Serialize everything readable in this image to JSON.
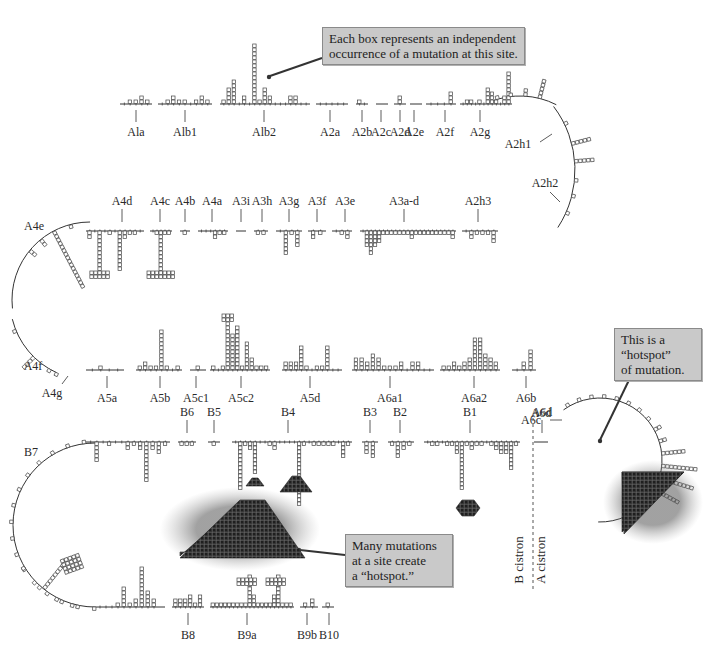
{
  "figure": {
    "colors": {
      "line": "#333333",
      "box_fill": "#ffffff",
      "box_stroke": "#444444",
      "hotspot_fill": "#2b2b2b",
      "callout_bg": "#c9c9c9",
      "callout_border": "#8a8a8a"
    }
  },
  "callouts": {
    "top": {
      "lines": [
        "Each box represents an independent",
        "occurrence of a mutation at this site."
      ]
    },
    "right": {
      "lines": [
        "This is a",
        "“hotspot”",
        "of mutation."
      ]
    },
    "bottom": {
      "lines": [
        "Many mutations",
        "at a site create",
        "a “hotspot.”"
      ]
    }
  },
  "cistron_divider": {
    "b_label": "B cistron",
    "a_label": "A cistron"
  },
  "rows": {
    "row1": {
      "y": 104,
      "segments": [
        {
          "label": "Ala",
          "x1": 120,
          "x2": 152,
          "lx": 136,
          "sites": [
            0,
            1,
            1,
            2,
            1
          ]
        },
        {
          "label": "Alb1",
          "x1": 158,
          "x2": 212,
          "lx": 185,
          "sites": [
            0,
            1,
            2,
            1,
            1,
            0,
            1,
            2,
            1
          ]
        },
        {
          "label": "Alb2",
          "x1": 220,
          "x2": 310,
          "lx": 264,
          "sites": [
            1,
            4,
            6,
            0,
            2,
            0,
            15,
            1,
            4,
            2,
            0,
            0,
            0,
            2,
            2,
            0,
            0
          ]
        },
        {
          "label": "A2a",
          "x1": 316,
          "x2": 348,
          "lx": 330,
          "sites": [
            0,
            0,
            0,
            0,
            0
          ]
        },
        {
          "label": "A2b",
          "x1": 356,
          "x2": 368,
          "lx": 362,
          "sites": [
            1,
            0
          ]
        },
        {
          "label": "A2c",
          "x1": 376,
          "x2": 388,
          "lx": 381,
          "sites": []
        },
        {
          "label": "A2d",
          "x1": 394,
          "x2": 406,
          "lx": 400,
          "sites": [
            2
          ]
        },
        {
          "label": "A2e",
          "x1": 410,
          "x2": 422,
          "lx": 414,
          "sites": []
        },
        {
          "label": "A2f",
          "x1": 426,
          "x2": 456,
          "lx": 445,
          "sites": [
            0,
            0,
            0,
            3
          ]
        },
        {
          "label": "A2g",
          "x1": 460,
          "x2": 512,
          "lx": 480,
          "sites": [
            0,
            1,
            1,
            0,
            1,
            0,
            4,
            3,
            1,
            0,
            2,
            8
          ]
        }
      ]
    },
    "row2": {
      "y": 231,
      "segments": [
        {
          "label": "A4d",
          "x1": 86,
          "x2": 144,
          "lx": 122,
          "down": [
            2,
            0,
            10,
            0,
            1,
            0,
            10,
            2,
            1,
            1,
            0
          ],
          "caps": [
            [
              2,
              4
            ]
          ]
        },
        {
          "label": "A4c",
          "x1": 150,
          "x2": 172,
          "lx": 160,
          "down": [
            0,
            1,
            10,
            1,
            1
          ],
          "caps": [
            [
              2,
              6
            ]
          ]
        },
        {
          "label": "A4b",
          "x1": 180,
          "x2": 190,
          "lx": 185,
          "down": [
            1
          ]
        },
        {
          "label": "A4a",
          "x1": 198,
          "x2": 228,
          "lx": 212,
          "down": [
            0,
            0,
            0,
            2,
            1,
            1
          ]
        },
        {
          "label": "A3i",
          "x1": 236,
          "x2": 246,
          "lx": 241,
          "down": []
        },
        {
          "label": "A3h",
          "x1": 254,
          "x2": 268,
          "lx": 262,
          "down": [
            1,
            1
          ]
        },
        {
          "label": "A3g",
          "x1": 276,
          "x2": 302,
          "lx": 289,
          "down": [
            0,
            6,
            1,
            4
          ]
        },
        {
          "label": "A3f",
          "x1": 308,
          "x2": 326,
          "lx": 317,
          "down": [
            2,
            1
          ]
        },
        {
          "label": "A3e",
          "x1": 332,
          "x2": 352,
          "lx": 345,
          "down": [
            0,
            1,
            2
          ]
        },
        {
          "label": "A3a-d",
          "x1": 360,
          "x2": 456,
          "lx": 404,
          "down": [
            0,
            4,
            6,
            4,
            3,
            1,
            1,
            1,
            1,
            1,
            1,
            1,
            2,
            1,
            1,
            1,
            1,
            1,
            1,
            1,
            1,
            1,
            2
          ]
        },
        {
          "label": "A2h3",
          "x1": 462,
          "x2": 498,
          "lx": 478,
          "down": [
            0,
            2,
            1,
            1,
            1,
            3
          ]
        }
      ]
    },
    "row3": {
      "y": 370,
      "segments": [
        {
          "label": "A5a",
          "x1": 86,
          "x2": 124,
          "lx": 107,
          "sites": [
            0,
            1,
            0,
            0
          ]
        },
        {
          "label": "A5b",
          "x1": 136,
          "x2": 182,
          "lx": 160,
          "sites": [
            1,
            2,
            1,
            1,
            10,
            1,
            0,
            1
          ]
        },
        {
          "label": "A5c1",
          "x1": 190,
          "x2": 206,
          "lx": 196,
          "sites": [
            1
          ]
        },
        {
          "label": "A5c2",
          "x1": 210,
          "x2": 270,
          "lx": 241,
          "sites": [
            1,
            0,
            1,
            12,
            9,
            11,
            1,
            7,
            3,
            1,
            1,
            1
          ],
          "caps": [
            [
              3,
              3
            ]
          ]
        },
        {
          "label": "A5d",
          "x1": 282,
          "x2": 342,
          "lx": 310,
          "sites": [
            2,
            2,
            2,
            6,
            1,
            0,
            1,
            1,
            6,
            0,
            0
          ]
        },
        {
          "label": "A6a1",
          "x1": 352,
          "x2": 434,
          "lx": 390,
          "sites": [
            3,
            3,
            2,
            4,
            3,
            1,
            1,
            1,
            2,
            0,
            2,
            2,
            0,
            0
          ]
        },
        {
          "label": "A6a2",
          "x1": 440,
          "x2": 500,
          "lx": 474,
          "sites": [
            1,
            1,
            2,
            1,
            2,
            3,
            8,
            8,
            4,
            3,
            2
          ]
        },
        {
          "label": "A6b",
          "x1": 512,
          "x2": 536,
          "lx": 526,
          "sites": [
            0,
            2,
            5
          ]
        }
      ]
    },
    "row4": {
      "y": 442,
      "segments": [
        {
          "label": "B7",
          "x1": 86,
          "x2": 170,
          "lx": null,
          "down": [
            0,
            5,
            0,
            1,
            0,
            0,
            2,
            1,
            2,
            10,
            2,
            3,
            1
          ]
        },
        {
          "label": "B6",
          "x1": 178,
          "x2": 196,
          "lx": 187,
          "down": [
            1,
            1,
            1
          ]
        },
        {
          "label": "B5",
          "x1": 208,
          "x2": 220,
          "lx": 214,
          "down": [
            1
          ]
        },
        {
          "label": "B4",
          "x1": 232,
          "x2": 352,
          "lx": 288,
          "down": [
            0,
            12,
            1,
            2,
            8,
            0,
            0,
            1,
            2,
            0,
            0,
            0,
            0,
            16,
            1,
            0,
            1,
            1,
            1,
            1,
            1,
            0,
            4,
            1
          ]
        },
        {
          "label": "B3",
          "x1": 362,
          "x2": 378,
          "lx": 370,
          "down": [
            3,
            4
          ]
        },
        {
          "label": "B2",
          "x1": 388,
          "x2": 414,
          "lx": 400,
          "down": [
            1,
            4,
            2,
            1
          ]
        },
        {
          "label": "B1",
          "x1": 424,
          "x2": 520,
          "lx": 470,
          "down": [
            0,
            1,
            1,
            0,
            1,
            1,
            3,
            12,
            1,
            2,
            1,
            1,
            0,
            1,
            2,
            3,
            3,
            7,
            1
          ]
        },
        {
          "label": "A6d",
          "x1": 534,
          "x2": 548,
          "lx": 542,
          "down": []
        }
      ]
    },
    "row5": {
      "y": 607,
      "segments": [
        {
          "label": "B8",
          "x1": 172,
          "x2": 204,
          "lx": 188,
          "sites": [
            2,
            2,
            2,
            3,
            1,
            3
          ]
        },
        {
          "label": "B9a",
          "x1": 210,
          "x2": 294,
          "lx": 247,
          "sites": [
            1,
            1,
            1,
            1,
            1,
            1,
            1,
            1,
            1,
            8,
            3,
            1,
            1,
            1,
            1,
            3,
            8,
            1,
            1,
            1
          ]
        },
        {
          "label": "B9b",
          "x1": 300,
          "x2": 318,
          "lx": 307,
          "sites": [
            1,
            2
          ]
        },
        {
          "label": "B10",
          "x1": 322,
          "x2": 334,
          "lx": 329,
          "sites": [
            1
          ]
        }
      ]
    }
  },
  "extra_labels": {
    "A4e": "A4e",
    "A4f": "A4f",
    "A4g": "A4g",
    "A2h1": "A2h1",
    "A2h2": "A2h2",
    "A6c": "A6c",
    "B7": "B7",
    "A6d": "A6d"
  },
  "hotspot_counts": {
    "Alb2_top_cap": 5,
    "A4c_cross": 6,
    "B4_big_triangle": "~500",
    "B4_small_triangle": "~40",
    "B1_diamond": "~30",
    "A6c_triangle": "~400"
  }
}
